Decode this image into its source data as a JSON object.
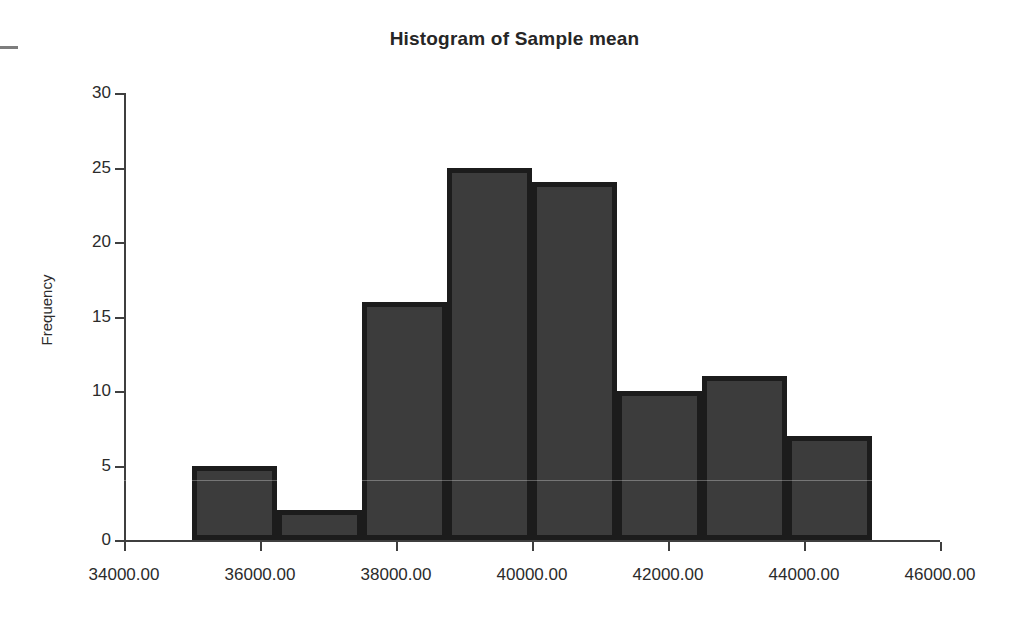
{
  "chart_data": {
    "type": "bar",
    "title": "Histogram of Sample mean",
    "xlabel": "",
    "ylabel": "Frequency",
    "categories": [
      "35000.00",
      "36250.00",
      "37500.00",
      "38750.00",
      "40000.00",
      "41250.00",
      "42500.00",
      "43750.00"
    ],
    "bin_edges": [
      35000,
      36250,
      37500,
      38750,
      40000,
      41250,
      42500,
      43750,
      45000
    ],
    "values": [
      5,
      2,
      16,
      25,
      24,
      10,
      11,
      7
    ],
    "xlim": [
      34000,
      46000
    ],
    "ylim": [
      0,
      30
    ],
    "x_ticks": [
      "34000.00",
      "36000.00",
      "38000.00",
      "40000.00",
      "42000.00",
      "44000.00",
      "46000.00"
    ],
    "x_tick_values": [
      34000,
      36000,
      38000,
      40000,
      42000,
      44000,
      46000
    ],
    "y_ticks": [
      "0",
      "5",
      "10",
      "15",
      "20",
      "25",
      "30"
    ],
    "y_tick_values": [
      0,
      5,
      10,
      15,
      20,
      25,
      30
    ],
    "grid": false,
    "legend": null,
    "bar_fill_color": "#3c3c3c",
    "bar_border_color": "#1c1c1c",
    "axis_color": "#3f3f3f",
    "background_color": "#ffffff"
  }
}
